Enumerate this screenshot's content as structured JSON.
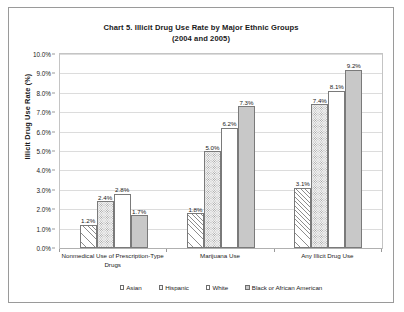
{
  "chart_data": {
    "type": "bar",
    "title": "Chart 5. Illicit Drug Use Rate by Major Ethnic Groups (2004 and 2005)",
    "title_line1": "Chart 5. Illicit Drug Use Rate by Major Ethnic Groups",
    "title_line2": "(2004 and 2005)",
    "xlabel": "",
    "ylabel": "Illicit Drug Use Rate (%)",
    "ylim": [
      0,
      10
    ],
    "ytick_labels": [
      "10.0%",
      "9.0%",
      "8.0%",
      "7.0%",
      "6.0%",
      "5.0%",
      "4.0%",
      "3.0%",
      "2.0%",
      "1.0%",
      "0.0%"
    ],
    "ytick_values": [
      10,
      9,
      8,
      7,
      6,
      5,
      4,
      3,
      2,
      1,
      0
    ],
    "grid": true,
    "legend_position": "bottom",
    "categories": [
      "Nonmedical Use of Prescription-Type Drugs",
      "Marijuana Use",
      "Any Illicit Drug Use"
    ],
    "category_lines": [
      [
        "Nonmedical Use of Prescription-Type",
        "Drugs"
      ],
      [
        "Marijuana Use"
      ],
      [
        "Any Illicit Drug Use"
      ]
    ],
    "series": [
      {
        "name": "Asian",
        "fill": "diagonal-hatch",
        "values": [
          1.2,
          1.8,
          3.1
        ],
        "labels": [
          "1.2%",
          "1.8%",
          "3.1%"
        ]
      },
      {
        "name": "Hispanic",
        "fill": "dotted",
        "values": [
          2.4,
          5.0,
          7.4
        ],
        "labels": [
          "2.4%",
          "5.0%",
          "7.4%"
        ]
      },
      {
        "name": "White",
        "fill": "solid-white",
        "values": [
          2.8,
          6.2,
          8.1
        ],
        "labels": [
          "2.8%",
          "6.2%",
          "8.1%"
        ]
      },
      {
        "name": "Black or African American",
        "fill": "solid-gray",
        "values": [
          1.7,
          7.3,
          9.2
        ],
        "labels": [
          "1.7%",
          "7.3%",
          "9.2%"
        ]
      }
    ]
  },
  "colors": {
    "bar_outline": "#7a7a7a",
    "gridline": "#dcdcdc",
    "plot_border": "#c4c4c4",
    "frame_border": "#9a9a9a",
    "text": "#1a1a1a",
    "hispanic_fill": "#f2f2f2",
    "black_fill": "#c8c8c8"
  }
}
